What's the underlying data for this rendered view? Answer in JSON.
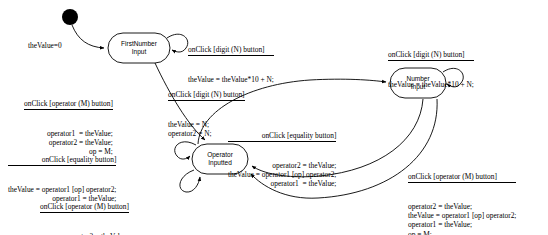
{
  "diagram": {
    "type": "uml-state-machine",
    "background": "#ffffff",
    "stroke": "#000000"
  },
  "initial": {
    "name": "initial-state",
    "label": "theValue=0"
  },
  "states": [
    {
      "id": "first_number_input",
      "label": "FirstNumber\nInput"
    },
    {
      "id": "number_input",
      "label": "Number\nInput"
    },
    {
      "id": "operator_inputted",
      "label": "Operator\nInputted"
    }
  ],
  "transitions": [
    {
      "id": "t-first-self-digit",
      "from": "first_number_input",
      "to": "first_number_input",
      "guard": "onClick [digit (N) button]",
      "effect": "theValue = theValue*10 + N;",
      "align": "left"
    },
    {
      "id": "t-first-to-operator-m",
      "from": "first_number_input",
      "to": "operator_inputted",
      "guard": "onClick [operator (M) button]",
      "effect": "operator1  = theValue;\noperator2 = theValue;\nop = M;",
      "align": "right"
    },
    {
      "id": "t-operator-to-number-digit",
      "from": "operator_inputted",
      "to": "number_input",
      "guard": "onClick [digit (N) button]",
      "effect": "theValue = N;\noperator2 = N;",
      "align": "left"
    },
    {
      "id": "t-number-self-digit",
      "from": "number_input",
      "to": "number_input",
      "guard": "onClick [digit (N) button]",
      "effect": "theValue = theValue*10 + N;",
      "align": "left"
    },
    {
      "id": "t-number-to-operator-equality",
      "from": "number_input",
      "to": "operator_inputted",
      "guard": "onClick [equality button]",
      "effect": "operator2 = theValue;\ntheValue = operator1 [op] operator2;\noperator1  = theValue;",
      "align": "right"
    },
    {
      "id": "t-number-to-operator-m",
      "from": "number_input",
      "to": "operator_inputted",
      "guard": "onClick [operator (M) button]",
      "effect": "operator2 = theValue;\ntheValue = operator1 [op] operator2;\noperator1 = theValue;\nop = M;",
      "align": "left"
    },
    {
      "id": "t-operator-self-equality",
      "from": "operator_inputted",
      "to": "operator_inputted",
      "guard": "onClick [equality button]",
      "effect": "theValue = operator1 [op] operator2;\noperator1 = theValue;",
      "align": "right"
    },
    {
      "id": "t-operator-self-m",
      "from": "operator_inputted",
      "to": "operator_inputted",
      "guard": "onClick [operator (M) button]",
      "effect": "operator2 = theValue;\nop = M;",
      "align": "right"
    }
  ]
}
